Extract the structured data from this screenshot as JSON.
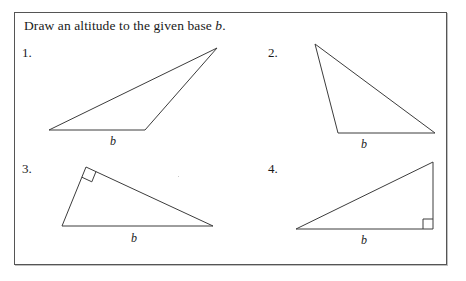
{
  "worksheet": {
    "prompt_prefix": "Draw an altitude to the given base ",
    "prompt_variable": "b",
    "prompt_suffix": ".",
    "border_color": "#555555",
    "ink_color": "#3c3c3c",
    "background_color": "#ffffff"
  },
  "problems": [
    {
      "number": "1.",
      "base_label": "b",
      "shape": "obtuse-triangle",
      "right_angle_marked": false,
      "vertices": [
        [
          49,
          130
        ],
        [
          145,
          130
        ],
        [
          217,
          48
        ]
      ],
      "base_edge": [
        [
          49,
          130
        ],
        [
          145,
          130
        ]
      ]
    },
    {
      "number": "2.",
      "base_label": "b",
      "shape": "obtuse-triangle",
      "right_angle_marked": false,
      "vertices": [
        [
          315,
          44
        ],
        [
          338,
          133
        ],
        [
          435,
          133
        ]
      ],
      "base_edge": [
        [
          338,
          133
        ],
        [
          435,
          133
        ]
      ]
    },
    {
      "number": "3.",
      "base_label": "b",
      "shape": "right-triangle",
      "right_angle_marked": true,
      "right_angle_vertex": [
        86,
        167
      ],
      "vertices": [
        [
          86,
          167
        ],
        [
          62,
          226
        ],
        [
          213,
          226
        ]
      ],
      "base_edge": [
        [
          62,
          226
        ],
        [
          213,
          226
        ]
      ]
    },
    {
      "number": "4.",
      "base_label": "b",
      "shape": "right-triangle",
      "right_angle_marked": true,
      "right_angle_vertex": [
        433,
        229
      ],
      "vertices": [
        [
          296,
          229
        ],
        [
          433,
          229
        ],
        [
          433,
          162
        ]
      ],
      "base_edge": [
        [
          296,
          229
        ],
        [
          433,
          229
        ]
      ]
    }
  ]
}
